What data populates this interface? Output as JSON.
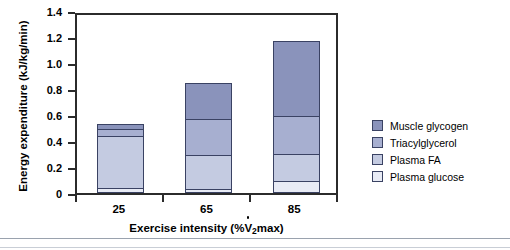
{
  "chart_data": {
    "type": "bar",
    "subtype": "stacked-vertical",
    "title": "",
    "xlabel": "Exercise intensity (%VO2max)",
    "xlabel_parts": {
      "prefix": "Exercise intensity (%",
      "vdot": "V",
      "sub": "2",
      "suffix": "max)"
    },
    "ylabel": "Energy expenditure (kJ/kg/min)",
    "categories": [
      "25",
      "65",
      "85"
    ],
    "ylim": [
      0,
      1.4
    ],
    "yticks": [
      "0",
      "0.2",
      "0.4",
      "0.6",
      "0.8",
      "1.0",
      "1.2",
      "1.4"
    ],
    "ytick_values": [
      0,
      0.2,
      0.4,
      0.6,
      0.8,
      1.0,
      1.2,
      1.4
    ],
    "grid": false,
    "legend_position": "right",
    "series": [
      {
        "name": "Plasma glucose",
        "color": "#e8ebf5",
        "values": [
          0.04,
          0.03,
          0.09
        ]
      },
      {
        "name": "Plasma FA",
        "color": "#c4cbe1",
        "values": [
          0.4,
          0.26,
          0.21
        ]
      },
      {
        "name": "Triacylglycerol",
        "color": "#a7afd0",
        "values": [
          0.05,
          0.28,
          0.29
        ]
      },
      {
        "name": "Muscle glycogen",
        "color": "#8a93bb",
        "values": [
          0.04,
          0.28,
          0.58
        ]
      }
    ],
    "totals": [
      0.53,
      0.85,
      1.17
    ]
  },
  "legend": {
    "items": [
      {
        "label": "Muscle glycogen",
        "color": "#8a93bb"
      },
      {
        "label": "Triacylglycerol",
        "color": "#a7afd0"
      },
      {
        "label": "Plasma FA",
        "color": "#c4cbe1"
      },
      {
        "label": "Plasma glucose",
        "color": "#e8ebf5"
      }
    ]
  },
  "style": {
    "axis_color": "#2b2b2b",
    "bar_border": "#3a4263",
    "background": "#ffffff"
  }
}
